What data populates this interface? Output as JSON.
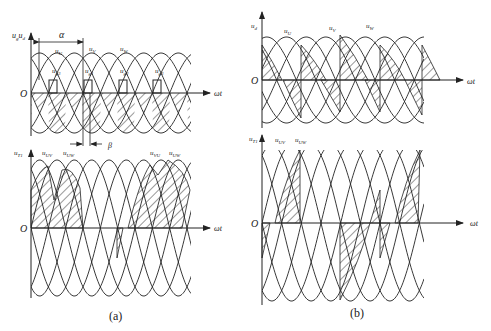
{
  "figure": {
    "panel_a": {
      "caption": "(a)",
      "top": {
        "y_label": "u_g, u_d",
        "y_label_main": "u",
        "y_label_sub": "g",
        "y_label_main2": "u",
        "y_label_sub2": "d",
        "origin": "O",
        "x_label": "ωt",
        "phase_labels": [
          {
            "main": "u",
            "sub": "U"
          },
          {
            "main": "u",
            "sub": "V"
          },
          {
            "main": "u",
            "sub": "W"
          }
        ],
        "gate_labels": [
          {
            "main": "u",
            "sub": "g3"
          },
          {
            "main": "u",
            "sub": "g1"
          },
          {
            "main": "u",
            "sub": "g2"
          },
          {
            "main": "u",
            "sub": "g3"
          }
        ],
        "alpha_label": "α",
        "beta_label": "β"
      },
      "bottom": {
        "y_label_main": "u",
        "y_label_sub": "T1",
        "origin": "O",
        "x_label": "ωt",
        "line_labels": [
          {
            "main": "u",
            "sub": "UV"
          },
          {
            "main": "u",
            "sub": "UW"
          },
          {
            "main": "u",
            "sub": "VU"
          },
          {
            "main": "u",
            "sub": "UW"
          }
        ]
      }
    },
    "panel_b": {
      "caption": "(b)",
      "top": {
        "y_label_main": "u",
        "y_label_sub": "d",
        "origin": "O",
        "x_label": "ωt",
        "phase_labels": [
          {
            "main": "u",
            "sub": "U"
          },
          {
            "main": "u",
            "sub": "V"
          },
          {
            "main": "u",
            "sub": "W"
          }
        ]
      },
      "bottom": {
        "y_label_main": "u",
        "y_label_sub": "T1",
        "origin": "O",
        "x_label": "ωt",
        "line_labels": [
          {
            "main": "u",
            "sub": "UV"
          },
          {
            "main": "u",
            "sub": "UW"
          }
        ]
      }
    }
  }
}
